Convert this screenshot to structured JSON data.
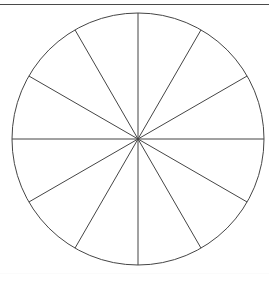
{
  "page": {
    "width": 269,
    "height": 282,
    "background_color": "#ffffff"
  },
  "top_rule": {
    "name": "horizontal-rule-top",
    "color": "#4a4a4a",
    "y": 4,
    "thickness": 1.5
  },
  "bottom_rule": {
    "name": "horizontal-rule-bottom",
    "color": "#fbfbfb",
    "y": 273,
    "thickness": 1
  },
  "figure": {
    "type": "sector-circle",
    "caption": "",
    "stroke_color": "#454545",
    "stroke_width": 1,
    "fill_color": "none",
    "circle": {
      "center_x": 138,
      "center_y": 139,
      "radius": 126
    },
    "sector_count": 12,
    "sector_angle_degrees": 30,
    "diameter_count": 6,
    "diameter_angles_degrees": [
      0,
      30,
      60,
      90,
      120,
      150
    ],
    "sector_labels": [],
    "diameters": [
      {
        "name": "diameter-0deg",
        "angle": 0
      },
      {
        "name": "diameter-30deg",
        "angle": 30
      },
      {
        "name": "diameter-60deg",
        "angle": 60
      },
      {
        "name": "diameter-90deg",
        "angle": 90
      },
      {
        "name": "diameter-120deg",
        "angle": 120
      },
      {
        "name": "diameter-150deg",
        "angle": 150
      }
    ]
  }
}
